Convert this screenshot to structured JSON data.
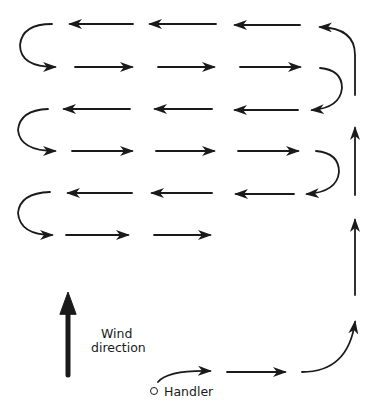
{
  "diagram": {
    "type": "search-pattern",
    "stroke_color": "#1a1a1a",
    "background_color": "#ffffff",
    "labels": {
      "wind_line1": "Wind",
      "wind_line2": "direction",
      "handler": "Handler"
    },
    "rows": [
      {
        "y": 24,
        "direction": "left"
      },
      {
        "y": 67,
        "direction": "right"
      },
      {
        "y": 109,
        "direction": "left"
      },
      {
        "y": 151,
        "direction": "right"
      },
      {
        "y": 193,
        "direction": "left"
      },
      {
        "y": 235,
        "direction": "right"
      }
    ],
    "nodes": [
      {
        "id": "handler",
        "label": "Handler"
      },
      {
        "id": "wind-indicator",
        "label": "Wind direction"
      }
    ]
  }
}
